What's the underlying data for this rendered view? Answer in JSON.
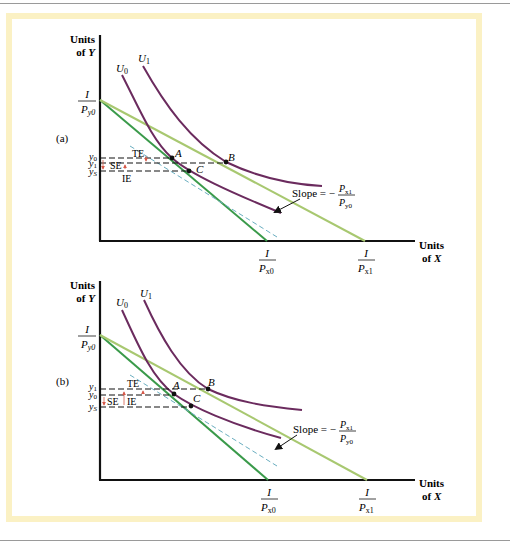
{
  "figure": {
    "panels": [
      {
        "id": "a",
        "label": "(a)",
        "y_axis_label": [
          "Units",
          "of Y"
        ],
        "x_axis_label": [
          "Units",
          "of X"
        ],
        "y_intercept": {
          "num": "I",
          "den": "P",
          "sub": "y0"
        },
        "x_intercept_0": {
          "num": "I",
          "den": "P",
          "sub": "x0"
        },
        "x_intercept_1": {
          "num": "I",
          "den": "P",
          "sub": "x1"
        },
        "curves": {
          "U0": "U",
          "U0_sub": "0",
          "U1": "U",
          "U1_sub": "1"
        },
        "points": [
          "A",
          "B",
          "C"
        ],
        "y_levels": [
          {
            "name": "y",
            "sub": "0"
          },
          {
            "name": "y",
            "sub": "1"
          },
          {
            "name": "y",
            "sub": "S"
          }
        ],
        "effects": {
          "total": "TE",
          "substitution": "SE",
          "income": "IE"
        },
        "slope_label": "Slope = −",
        "slope_num": {
          "base": "P",
          "sub": "x1"
        },
        "slope_den": {
          "base": "P",
          "sub": "y0"
        }
      },
      {
        "id": "b",
        "label": "(b)",
        "y_axis_label": [
          "Units",
          "of Y"
        ],
        "x_axis_label": [
          "Units",
          "of X"
        ],
        "y_intercept": {
          "num": "I",
          "den": "P",
          "sub": "y0"
        },
        "x_intercept_0": {
          "num": "I",
          "den": "P",
          "sub": "x0"
        },
        "x_intercept_1": {
          "num": "I",
          "den": "P",
          "sub": "x1"
        },
        "curves": {
          "U0": "U",
          "U0_sub": "0",
          "U1": "U",
          "U1_sub": "1"
        },
        "points": [
          "A",
          "B",
          "C"
        ],
        "y_levels": [
          {
            "name": "y",
            "sub": "1"
          },
          {
            "name": "y",
            "sub": "0"
          },
          {
            "name": "y",
            "sub": "S"
          }
        ],
        "effects": {
          "total": "TE",
          "substitution": "SE",
          "income": "IE"
        },
        "slope_label": "Slope = −",
        "slope_num": {
          "base": "P",
          "sub": "x1"
        },
        "slope_den": {
          "base": "P",
          "sub": "y0"
        }
      }
    ],
    "colors": {
      "budget_initial": "#3a9a4a",
      "budget_new": "#a8c870",
      "indifference": "#6b2b5e",
      "dashed_parallel": "#6aaec0",
      "arrows": "#d65a4a",
      "frame": "#fbf1c4"
    }
  }
}
